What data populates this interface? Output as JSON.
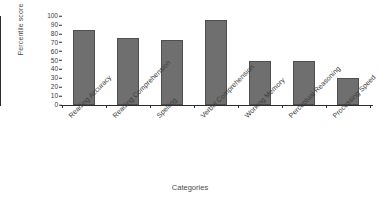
{
  "chart_data": {
    "type": "bar",
    "title": "",
    "xlabel": "Categories",
    "ylabel": "Percentile score",
    "categories": [
      "Reading Accuracy",
      "Reading Comprehension",
      "Spelling",
      "Verbal Comprehension",
      "Working Memory",
      "Perceptual Reasoning",
      "Processing Speed"
    ],
    "values": [
      84,
      75,
      73,
      95,
      49,
      49,
      30
    ],
    "ylim": [
      0,
      100
    ],
    "ytick_labels": [
      "100",
      "90",
      "80",
      "70",
      "60",
      "50",
      "40",
      "30",
      "20",
      "10",
      "0"
    ],
    "ytick_values": [
      100,
      90,
      80,
      70,
      60,
      50,
      40,
      30,
      20,
      10,
      0
    ],
    "grid": false,
    "legend": false,
    "bar_color": "#6f6f6f",
    "bar_edge_color": "#4f4f4f",
    "axis_color": "#2d2d2d",
    "background": "#ffffff"
  }
}
